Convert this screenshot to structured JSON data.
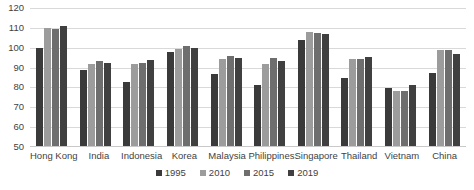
{
  "chart_data": {
    "type": "bar",
    "title": "",
    "subtitle": "",
    "xlabel": "",
    "ylabel": "",
    "ylim": [
      50,
      120
    ],
    "ytick_step": 10,
    "yticks": [
      50,
      60,
      70,
      80,
      90,
      100,
      110,
      120
    ],
    "grid": true,
    "legend_position": "bottom-center",
    "categories": [
      "Hong Kong",
      "India",
      "Indonesia",
      "Korea",
      "Malaysia",
      "Philippines",
      "Singapore",
      "Thailand",
      "Vietnam",
      "China"
    ],
    "series": [
      {
        "name": "1995",
        "color": "#3a3a3a",
        "values": [
          100.0,
          89.0,
          82.5,
          98.0,
          87.0,
          81.0,
          104.0,
          85.0,
          79.5,
          87.5
        ]
      },
      {
        "name": "2010",
        "color": "#9c9c9c",
        "values": [
          110.0,
          92.0,
          92.0,
          99.5,
          94.5,
          92.0,
          108.0,
          94.5,
          78.0,
          99.0
        ]
      },
      {
        "name": "2015",
        "color": "#6e6e6e",
        "values": [
          109.5,
          93.5,
          92.5,
          101.0,
          96.0,
          95.0,
          107.5,
          94.5,
          78.0,
          99.0
        ]
      },
      {
        "name": "2019",
        "color": "#404040",
        "values": [
          111.0,
          92.5,
          94.0,
          100.0,
          95.0,
          93.5,
          107.0,
          95.5,
          81.0,
          97.0
        ]
      }
    ]
  }
}
